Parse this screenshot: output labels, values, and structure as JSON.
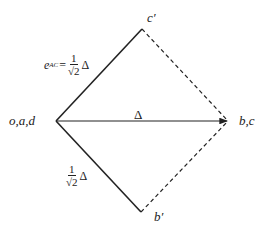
{
  "diagram": {
    "vertices": {
      "origin": {
        "label": "o,a,d",
        "x": 56,
        "y": 121
      },
      "top": {
        "label": "c′",
        "x": 142,
        "y": 29
      },
      "right": {
        "label": "b,c",
        "x": 228,
        "y": 121
      },
      "bottom": {
        "label": "b′",
        "x": 141,
        "y": 212
      }
    },
    "edges": [
      {
        "from": "origin",
        "to": "top",
        "style": "solid"
      },
      {
        "from": "origin",
        "to": "bottom",
        "style": "solid"
      },
      {
        "from": "origin",
        "to": "right",
        "style": "solid-arrow",
        "label": "Δ"
      },
      {
        "from": "top",
        "to": "right",
        "style": "dashed"
      },
      {
        "from": "bottom",
        "to": "right",
        "style": "dashed"
      }
    ],
    "upper_label": {
      "lhs": "e",
      "sub": "AC",
      "eq": "=",
      "num": "1",
      "den": "√2",
      "tail": "Δ"
    },
    "lower_label": {
      "num": "1",
      "den": "√2",
      "tail": "Δ"
    },
    "delta_label": "Δ",
    "stroke_color": "#222222"
  }
}
